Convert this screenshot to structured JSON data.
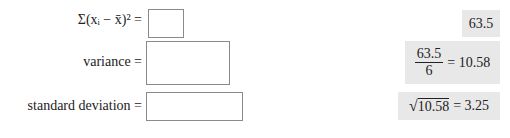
{
  "rows": [
    {
      "label_html": "sum_sq_dev",
      "label_text": "Σ(xᵢ − x̄)² =",
      "input_value": "",
      "answer": {
        "value": "63.5"
      }
    },
    {
      "label_text": "variance =",
      "input_value": "",
      "answer": {
        "numerator": "63.5",
        "denominator": "6",
        "equals": "= 10.58"
      }
    },
    {
      "label_text": "standard deviation =",
      "input_value": "",
      "answer": {
        "radicand": "10.58",
        "equals": "= 3.25"
      }
    }
  ]
}
